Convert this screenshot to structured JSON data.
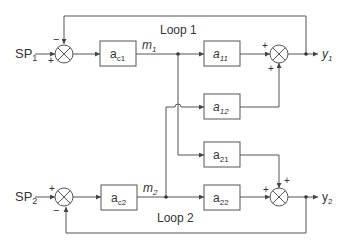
{
  "inputs": [
    {
      "id": "sp1",
      "label": "SP",
      "sub": "1"
    },
    {
      "id": "sp2",
      "label": "SP",
      "sub": "2"
    }
  ],
  "outputs": [
    {
      "id": "y1",
      "label": "y",
      "sub": "1"
    },
    {
      "id": "y2",
      "label": "y",
      "sub": "2"
    }
  ],
  "controllers": [
    {
      "id": "ac1",
      "label": "a",
      "sub": "c1"
    },
    {
      "id": "ac2",
      "label": "a",
      "sub": "c2"
    }
  ],
  "process_blocks": [
    {
      "id": "a11",
      "label": "a",
      "sub": "11"
    },
    {
      "id": "a12",
      "label": "a",
      "sub": "12"
    },
    {
      "id": "a21",
      "label": "a",
      "sub": "21"
    },
    {
      "id": "a22",
      "label": "a",
      "sub": "22"
    }
  ],
  "signals": [
    {
      "id": "m1",
      "label": "m",
      "sub": "1"
    },
    {
      "id": "m2",
      "label": "m",
      "sub": "2"
    }
  ],
  "loops": [
    {
      "id": "loop1",
      "label": "Loop 1"
    },
    {
      "id": "loop2",
      "label": "Loop 2"
    }
  ],
  "signs": {
    "sum_sp1_feedback": "−",
    "sum_sp1_input": "+",
    "sum_sp2_input": "+",
    "sum_sp2_feedback": "−",
    "sum_y1_a11": "+",
    "sum_y1_a12": "+",
    "sum_y2_a22": "+",
    "sum_y2_a21": "+"
  },
  "colors": {
    "line": "#555555",
    "text": "#333333",
    "background": "#ffffff"
  }
}
